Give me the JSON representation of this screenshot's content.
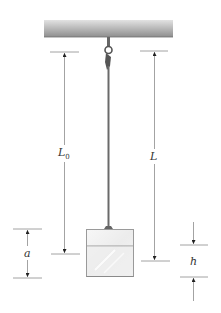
{
  "diagram": {
    "type": "physics-hanging-rod-with-box",
    "labels": {
      "L0": {
        "main": "L",
        "sub": "0"
      },
      "L": "L",
      "a": "a",
      "h": "h"
    },
    "colors": {
      "ceiling_top": "#d8d8d8",
      "ceiling_bottom": "#8a8a8a",
      "rod": "#6a6a6a",
      "box_edge": "#9a9a9a",
      "box_fill": "#f1f1f1",
      "dimension_line": "#8c8c8c",
      "arrowhead": "#222222"
    }
  }
}
